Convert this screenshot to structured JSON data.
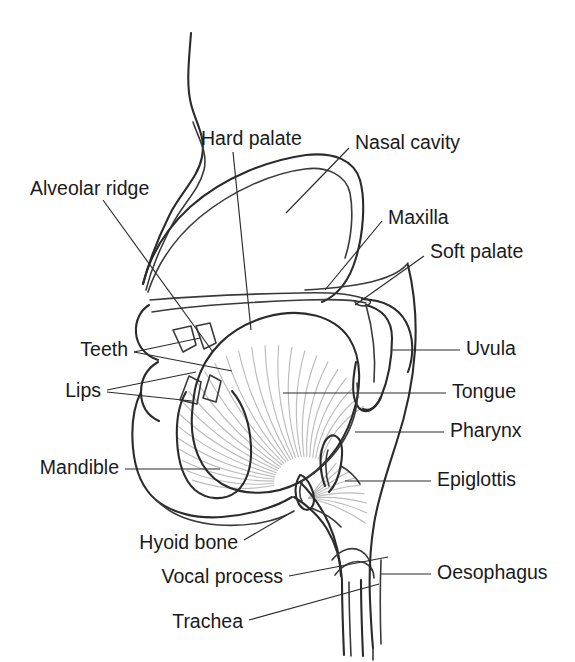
{
  "diagram": {
    "background_color": "#ffffff",
    "line_color": "#2b2b2b",
    "fiber_color": "#bcbcbc",
    "text_color": "#1a1a1a",
    "width": 575,
    "height": 662
  },
  "labels": [
    {
      "id": "hard-palate",
      "text": "Hard palate",
      "x": 201,
      "y": 140,
      "align": "start"
    },
    {
      "id": "nasal-cavity",
      "text": "Nasal cavity",
      "x": 355,
      "y": 144,
      "align": "start"
    },
    {
      "id": "alveolar-ridge",
      "text": "Alveolar ridge",
      "x": 30,
      "y": 190,
      "align": "start"
    },
    {
      "id": "maxilla",
      "text": "Maxilla",
      "x": 388,
      "y": 219,
      "align": "start"
    },
    {
      "id": "soft-palate",
      "text": "Soft palate",
      "x": 430,
      "y": 253,
      "align": "start"
    },
    {
      "id": "uvula",
      "text": "Uvula",
      "x": 466,
      "y": 350,
      "align": "start"
    },
    {
      "id": "teeth",
      "text": "Teeth",
      "x": 128,
      "y": 351,
      "align": "end"
    },
    {
      "id": "tongue",
      "text": "Tongue",
      "x": 452,
      "y": 393,
      "align": "start"
    },
    {
      "id": "lips",
      "text": "Lips",
      "x": 101,
      "y": 392,
      "align": "end"
    },
    {
      "id": "pharynx",
      "text": "Pharynx",
      "x": 450,
      "y": 432,
      "align": "start"
    },
    {
      "id": "mandible",
      "text": "Mandible",
      "x": 119,
      "y": 469,
      "align": "end"
    },
    {
      "id": "epiglottis",
      "text": "Epiglottis",
      "x": 437,
      "y": 481,
      "align": "start"
    },
    {
      "id": "hyoid-bone",
      "text": "Hyoid bone",
      "x": 238,
      "y": 544,
      "align": "end"
    },
    {
      "id": "oesophagus",
      "text": "Oesophagus",
      "x": 437,
      "y": 574,
      "align": "start"
    },
    {
      "id": "vocal-process",
      "text": "Vocal process",
      "x": 283,
      "y": 578,
      "align": "end"
    },
    {
      "id": "trachea",
      "text": "Trachea",
      "x": 243,
      "y": 623,
      "align": "end"
    }
  ],
  "leaders": [
    {
      "id": "leader-hard-palate",
      "points": "233,152 251,330"
    },
    {
      "id": "leader-nasal-cavity",
      "points": "349,148 286,213"
    },
    {
      "id": "leader-alveolar-ridge",
      "points": "103,200 213,352"
    },
    {
      "id": "leader-maxilla",
      "points": "382,221 325,290"
    },
    {
      "id": "leader-soft-palate",
      "points": "424,256 355,305"
    },
    {
      "id": "leader-uvula",
      "points": "460,350 392,350"
    },
    {
      "id": "leader-teeth",
      "points": "134,352 232,371"
    },
    {
      "id": "leader-teeth-2",
      "points": "134,352 200,338"
    },
    {
      "id": "leader-tongue",
      "points": "446,393 283,393"
    },
    {
      "id": "leader-lips",
      "points": "107,390 196,372"
    },
    {
      "id": "leader-lips-2",
      "points": "107,392 192,401"
    },
    {
      "id": "leader-pharynx",
      "points": "444,432 355,432"
    },
    {
      "id": "leader-mandible",
      "points": "125,469 220,469"
    },
    {
      "id": "leader-epiglottis",
      "points": "431,481 345,481"
    },
    {
      "id": "leader-hyoid-bone",
      "points": "244,540 287,515"
    },
    {
      "id": "leader-oesophagus",
      "points": "431,574 381,574"
    },
    {
      "id": "leader-vocal-process",
      "points": "289,576 388,557"
    },
    {
      "id": "leader-trachea",
      "points": "249,620 379,584"
    }
  ],
  "outlines": {
    "face_profile": "M 191,33 C 189,60 186,84 191,104 C 196,124 206,136 202,157 C 198,178 181,192 170,214 C 159,236 150,258 143,284",
    "face_profile_inner": "M 193,122 C 199,140 208,152 204,170 C 199,190 183,204 172,225 C 161,247 152,266 146,290",
    "nasal_cavity_outer": "M 143,284 C 150,256 166,229 190,207 C 225,176 270,160 306,155 C 334,152 354,160 360,180 C 366,202 363,235 356,258 C 349,282 336,296 322,302",
    "nasal_cavity_inner": "M 148,292 C 158,262 176,237 200,217 C 233,190 273,173 305,169 C 327,166 346,175 350,193 C 354,214 351,240 345,258",
    "hard_palate_top": "M 150,300 C 185,297 245,294 300,293 C 330,292 350,294 362,298",
    "hard_palate_bottom": "M 152,312 C 190,306 250,302 305,300 C 333,299 355,300 366,303",
    "palate_band_close": "M 362,298 C 370,299 373,302 368,305 C 362,307 355,305 355,301",
    "soft_palate_upper": "M 362,299 C 383,300 398,307 406,322 C 414,337 414,356 408,372",
    "soft_palate_lower": "M 366,305 C 382,309 392,320 392,338 C 392,360 388,380 381,397 C 375,410 366,415 359,408 C 352,400 352,382 356,362",
    "uvula_tip": "M 381,397 C 377,407 369,412 363,409",
    "maxilla_upper": "M 305,290 C 340,288 362,285 378,280 C 392,276 402,271 408,263",
    "upper_lip": "M 149,305 C 141,310 135,320 136,333 C 137,346 146,356 158,360",
    "teeth_upper_1": "M 173,330 L 183,352 L 196,345 L 191,326 Z",
    "teeth_upper_2": "M 196,326 L 204,349 L 216,343 L 210,323 Z",
    "teeth_lower_1": "M 180,400 L 189,376 L 201,382 L 197,404 Z",
    "teeth_lower_2": "M 203,398 L 210,375 L 221,381 L 216,402 Z",
    "tongue_body": "M 196,385 C 205,352 230,327 266,317 C 302,307 334,316 349,338 C 362,358 362,388 352,417 C 342,447 322,470 300,482 C 274,496 243,496 222,484 C 200,471 190,444 192,414 C 193,402 194,393 196,385",
    "tongue_root": "M 300,482 C 318,472 334,457 345,438 C 355,420 359,400 357,383",
    "lower_lip": "M 158,362 C 148,368 141,378 141,392 C 141,406 148,416 159,421",
    "mandible_outline": "M 186,392 C 179,404 176,420 177,440 C 178,462 184,480 195,490 C 207,500 224,501 236,492 C 247,483 252,466 251,447 C 250,424 243,404 232,391",
    "chin_profile": "M 141,392 C 134,406 131,426 133,448 C 135,470 143,489 156,500 C 172,513 196,519 222,517 C 250,515 276,507 292,497",
    "jaw_under": "M 156,500 C 170,514 192,523 219,525 C 250,527 278,521 294,511",
    "epiglottis": "M 325,486 C 320,473 319,457 323,446 C 326,437 332,433 337,437 C 342,441 343,452 341,464 C 339,477 334,487 329,492",
    "epiglottis_inner": "M 329,486 C 325,474 325,459 328,450",
    "larynx_front": "M 294,497 C 307,505 319,516 327,529 C 336,544 341,562 342,580",
    "pharynx_back_wall": "M 408,265 C 414,290 417,320 415,350 C 413,382 406,414 396,444 C 387,472 378,498 374,524 C 370,548 369,575 370,600 C 371,622 372,638 373,648",
    "pharynx_back_inner": "M 366,305 C 373,330 376,356 374,382",
    "tongue_back_down": "M 300,482 C 312,494 322,508 329,524 C 336,540 340,558 341,576",
    "hyoid_bone": "M 300,475 C 295,483 294,494 298,502 C 301,509 307,512 311,508 C 315,504 315,495 311,487 C 308,480 303,475 300,475",
    "hyoid_inner": "M 302,482 C 299,488 299,496 302,501",
    "vocal_fold_region": "M 332,560 C 341,549 352,546 361,551 C 368,555 371,563 371,570",
    "vocal_fold_region_2": "M 335,575 C 344,563 356,559 365,563 C 371,566 374,572 374,578",
    "trachea_front": "M 342,580 C 342,605 343,630 344,655",
    "trachea_back": "M 361,580 C 361,606 362,632 363,656",
    "trachea_inner_1": "M 349,582 C 349,607 350,632 351,656",
    "oesophagus_line": "M 381,560 C 380,586 380,614 381,644",
    "neck_back": "M 373,648 C 373,652 373,656 373,660",
    "epiglottis_valley": "M 341,466 C 348,470 355,476 360,484",
    "aryepiglottic": "M 311,508 C 322,512 333,518 341,527"
  },
  "tongue_fibers": {
    "count": 26,
    "origin_x": 300,
    "origin_y": 487,
    "description": "radiating muscle fibers of the tongue body"
  },
  "hyoid_fibers": {
    "count": 9,
    "description": "fibers radiating from hyoid bone toward epiglottic valley"
  }
}
